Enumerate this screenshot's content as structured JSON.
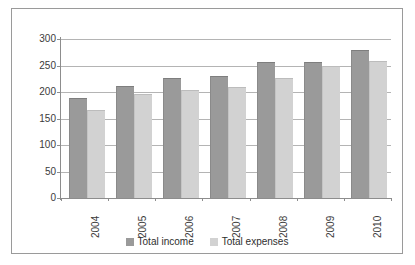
{
  "chart_data": {
    "type": "bar",
    "title": "",
    "xlabel": "",
    "ylabel": "",
    "categories": [
      "2004",
      "2005",
      "2006",
      "2007",
      "2008",
      "2009",
      "2010"
    ],
    "series": [
      {
        "name": "Total income",
        "color": "#9a9a9a",
        "values": [
          188,
          212,
          226,
          231,
          257,
          256,
          279
        ]
      },
      {
        "name": "Total expenses",
        "color": "#d2d2d2",
        "values": [
          166,
          196,
          203,
          209,
          227,
          250,
          258
        ]
      }
    ],
    "ylim": [
      0,
      300
    ],
    "yticks": [
      0,
      50,
      100,
      150,
      200,
      250,
      300
    ],
    "ytick_labels": [
      "0",
      "50",
      "100",
      "150",
      "200",
      "250",
      "300"
    ],
    "grid": true,
    "legend_position": "bottom"
  },
  "legend": {
    "items": [
      {
        "label": "Total income"
      },
      {
        "label": "Total expenses"
      }
    ]
  }
}
